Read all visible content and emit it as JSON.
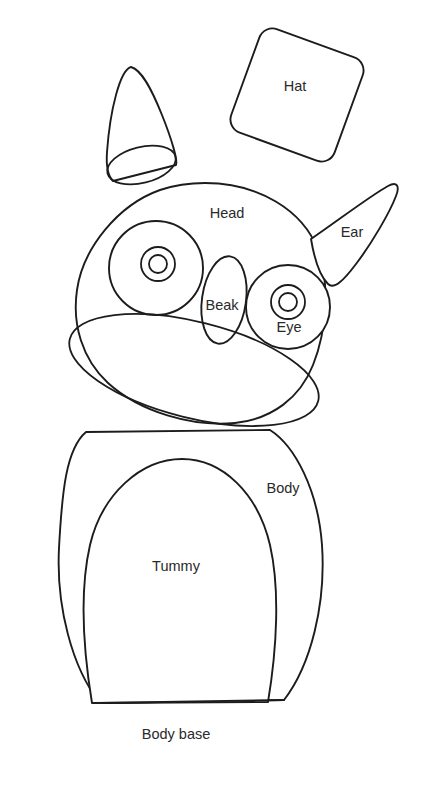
{
  "document": {
    "title": "Owl Softie Sewing Pattern Template",
    "background_color": "#ffffff",
    "line_color": "#1c1c1c",
    "label_color": "#2a2a2a",
    "canvas": {
      "width": 421,
      "height": 785
    }
  },
  "pieces": [
    {
      "id": "cone",
      "name": "cone-piece",
      "label": "",
      "shape": "cone",
      "label_x": 0,
      "label_y": 0
    },
    {
      "id": "hat",
      "name": "hat-piece",
      "label": "Hat",
      "shape": "rounded-square-rotated",
      "label_x": 295,
      "label_y": 87
    },
    {
      "id": "head",
      "name": "head-piece",
      "label": "Head",
      "shape": "rounded-dome",
      "label_x": 227,
      "label_y": 214
    },
    {
      "id": "ear",
      "name": "ear-piece",
      "label": "Ear",
      "shape": "tapered-curved-triangle",
      "label_x": 352,
      "label_y": 233
    },
    {
      "id": "eye-left",
      "name": "eye-left-piece",
      "label": "",
      "shape": "concentric-circles",
      "label_x": 0,
      "label_y": 0
    },
    {
      "id": "eye-right",
      "name": "eye-right-piece",
      "label": "Eye",
      "shape": "concentric-circles",
      "label_x": 289,
      "label_y": 328
    },
    {
      "id": "beak",
      "name": "beak-piece",
      "label": "Beak",
      "shape": "narrow-ellipse",
      "label_x": 222,
      "label_y": 306
    },
    {
      "id": "chin",
      "name": "chin-piece",
      "label": "",
      "shape": "tilted-ellipse",
      "label_x": 0,
      "label_y": 0
    },
    {
      "id": "body",
      "name": "body-piece",
      "label": "Body",
      "shape": "barrel",
      "label_x": 283,
      "label_y": 489
    },
    {
      "id": "tummy",
      "name": "tummy-piece",
      "label": "Tummy",
      "shape": "rounded-oval",
      "label_x": 176,
      "label_y": 567
    },
    {
      "id": "body-base",
      "name": "body-base-piece",
      "label": "Body base",
      "shape": "flat-edge",
      "label_x": 176,
      "label_y": 735
    }
  ],
  "labels": {
    "hat": "Hat",
    "head": "Head",
    "ear": "Ear",
    "eye": "Eye",
    "beak": "Beak",
    "body": "Body",
    "tummy": "Tummy",
    "body_base": "Body base"
  }
}
